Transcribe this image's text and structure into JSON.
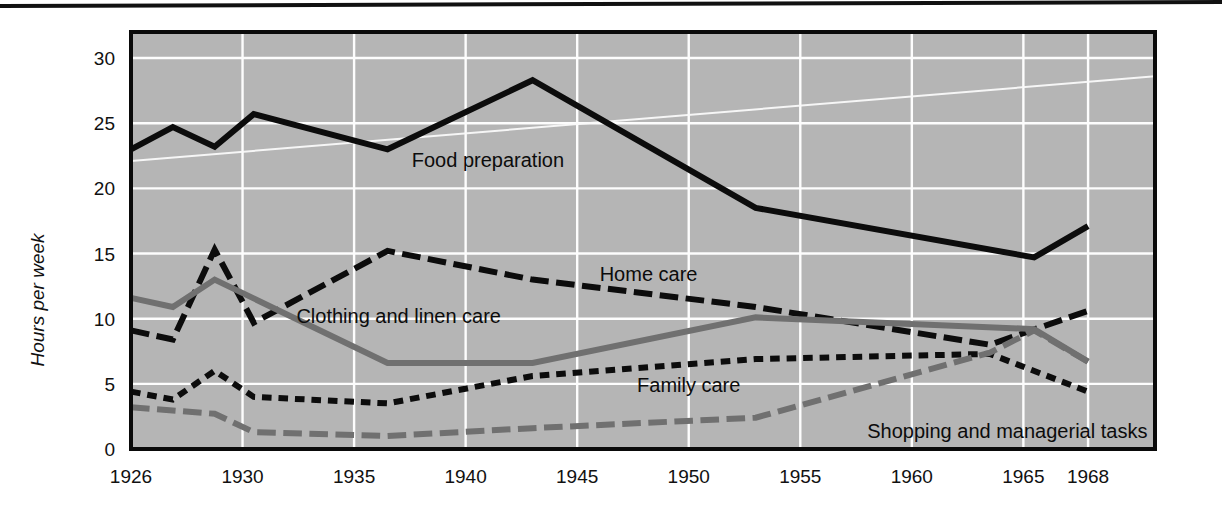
{
  "chart_data": {
    "type": "line",
    "title": "",
    "xlabel": "",
    "ylabel": "Hours per week",
    "xlim": [
      1926,
      1968
    ],
    "ylim": [
      0,
      32
    ],
    "yticks": [
      0,
      5,
      10,
      15,
      20,
      25,
      30
    ],
    "xticks": [
      1926,
      1930,
      1935,
      1940,
      1945,
      1950,
      1955,
      1960,
      1965,
      1968
    ],
    "grid": true,
    "legend_position": "inline-annotations",
    "background": "#b5b5b5",
    "series": [
      {
        "name": "Food preparation",
        "style": "solid",
        "color": "#0c0c0c",
        "width": 6,
        "x": [
          1926,
          1927.5,
          1929,
          1930.5,
          1936.5,
          1943,
          1953,
          1965.5,
          1968
        ],
        "values": [
          23.0,
          24.7,
          23.2,
          25.7,
          23.0,
          28.3,
          18.5,
          14.7,
          17.1
        ]
      },
      {
        "name": "Home care",
        "style": "dashed-long",
        "color": "#0c0c0c",
        "width": 6,
        "x": [
          1926,
          1927.5,
          1929,
          1930.5,
          1936.5,
          1943,
          1953,
          1963.5,
          1968
        ],
        "values": [
          9.1,
          8.4,
          15.3,
          9.7,
          15.2,
          13.0,
          10.9,
          8.0,
          10.6
        ]
      },
      {
        "name": "Clothing and linen care",
        "style": "solid",
        "color": "#707070",
        "width": 6,
        "x": [
          1926,
          1927.5,
          1929,
          1936.5,
          1943,
          1953,
          1965.5,
          1968
        ],
        "values": [
          11.6,
          10.9,
          13.0,
          6.6,
          6.6,
          10.1,
          9.2,
          6.7
        ]
      },
      {
        "name": "Family care",
        "style": "dashed-short",
        "color": "#0c0c0c",
        "width": 6,
        "x": [
          1926,
          1927.5,
          1929,
          1930.5,
          1936.5,
          1943,
          1953,
          1963.5,
          1968
        ],
        "values": [
          4.4,
          3.8,
          6.0,
          4.0,
          3.5,
          5.6,
          6.9,
          7.3,
          4.4
        ]
      },
      {
        "name": "Shopping and managerial tasks",
        "style": "dashed-long",
        "color": "#707070",
        "width": 6,
        "x": [
          1926,
          1929,
          1930.5,
          1936.5,
          1943,
          1953,
          1963.5,
          1965.5,
          1968
        ],
        "values": [
          3.2,
          2.7,
          1.3,
          1.0,
          1.6,
          2.4,
          7.4,
          9.1,
          6.7
        ]
      }
    ],
    "annotations": [
      {
        "text": "Food preparation",
        "x": 1941.0,
        "y": 22.2,
        "anchor": "middle"
      },
      {
        "text": "Home care",
        "x": 1948.2,
        "y": 13.4,
        "anchor": "middle"
      },
      {
        "text": "Clothing and linen care",
        "x": 1937.0,
        "y": 10.2,
        "anchor": "middle"
      },
      {
        "text": "Family care",
        "x": 1950.0,
        "y": 4.9,
        "anchor": "middle"
      },
      {
        "text": "Shopping and managerial tasks",
        "x": 1958.0,
        "y": 1.35,
        "anchor": "start"
      }
    ]
  }
}
